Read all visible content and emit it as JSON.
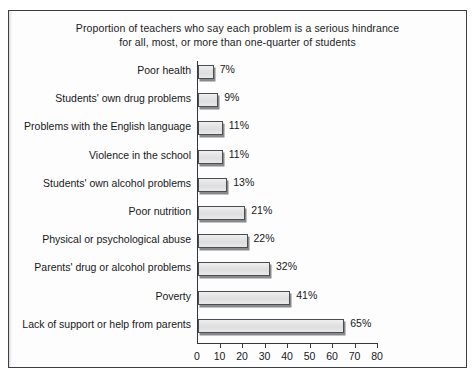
{
  "chart_data": {
    "type": "bar",
    "orientation": "horizontal",
    "title": "Proportion of teachers who say each problem is a serious hindrance for all, most, or more than one-quarter of students",
    "title_line1": "Proportion of teachers who say each problem is a serious hindrance",
    "title_line2": "for all, most, or more than one-quarter of students",
    "xlabel": "",
    "ylabel": "",
    "xlim": [
      0,
      80
    ],
    "xticks": [
      0,
      10,
      20,
      30,
      40,
      50,
      60,
      70,
      80
    ],
    "xtick_labels": [
      "0",
      "10",
      "20",
      "30",
      "40",
      "50",
      "60",
      "70",
      "80"
    ],
    "grid": false,
    "legend": false,
    "value_suffix": "%",
    "categories": [
      "Poor health",
      "Students' own drug problems",
      "Problems with the English language",
      "Violence in the school",
      "Students' own alcohol problems",
      "Poor nutrition",
      "Physical or psychological abuse",
      "Parents' drug or alcohol problems",
      "Poverty",
      "Lack of support or help from parents"
    ],
    "values": [
      7,
      9,
      11,
      11,
      13,
      21,
      22,
      32,
      41,
      65
    ],
    "value_labels": [
      "7%",
      "9%",
      "11%",
      "11%",
      "13%",
      "21%",
      "22%",
      "32%",
      "41%",
      "65%"
    ],
    "bars": [
      {
        "label": "Poor health",
        "value": 7,
        "value_label": "7%"
      },
      {
        "label": "Students' own drug problems",
        "value": 9,
        "value_label": "9%"
      },
      {
        "label": "Problems with the English language",
        "value": 11,
        "value_label": "11%"
      },
      {
        "label": "Violence in the school",
        "value": 11,
        "value_label": "11%"
      },
      {
        "label": "Students' own alcohol problems",
        "value": 13,
        "value_label": "13%"
      },
      {
        "label": "Poor nutrition",
        "value": 21,
        "value_label": "21%"
      },
      {
        "label": "Physical or psychological abuse",
        "value": 22,
        "value_label": "22%"
      },
      {
        "label": "Parents' drug or alcohol problems",
        "value": 32,
        "value_label": "32%"
      },
      {
        "label": "Poverty",
        "value": 41,
        "value_label": "41%"
      },
      {
        "label": "Lack of support or help from parents",
        "value": 65,
        "value_label": "65%"
      }
    ],
    "colors": {
      "bar_fill_light": "#efefef",
      "bar_fill_dark": "#dedede",
      "bar_border": "#4a4d52",
      "axis": "#34373c",
      "text": "#17181b",
      "background": "#fdfdfd"
    }
  }
}
